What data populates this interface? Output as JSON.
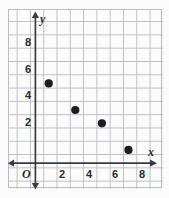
{
  "chart_data": {
    "type": "scatter",
    "title": "",
    "xlabel": "x",
    "ylabel": "y",
    "origin_label": "O",
    "x": [
      1,
      3,
      5,
      7
    ],
    "values": [
      6,
      4,
      3,
      1
    ],
    "points": [
      {
        "x": 1,
        "y": 6
      },
      {
        "x": 3,
        "y": 4
      },
      {
        "x": 5,
        "y": 3
      },
      {
        "x": 7,
        "y": 1
      }
    ],
    "xlim": [
      -1,
      9
    ],
    "ylim": [
      -1,
      9.5
    ],
    "xticks": [
      2,
      4,
      6,
      8
    ],
    "yticks": [
      2,
      4,
      6,
      8
    ],
    "xtick_labels": [
      "2",
      "4",
      "6",
      "8"
    ],
    "ytick_labels": [
      "2",
      "4",
      "6",
      "8"
    ],
    "grid": true,
    "grid_step": 1,
    "legend": null,
    "point_color": "#1d1d1f",
    "axis_color": "#3b3b3f",
    "grid_color": "#b9bcc0",
    "background_color": "#fcfcfc"
  }
}
